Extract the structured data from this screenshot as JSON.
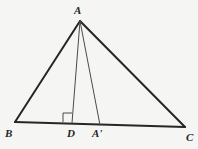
{
  "figure": {
    "kind": "geometry-diagram",
    "background_color": "#f5f5f4",
    "stroke_color": "#262626",
    "thin_stroke_color": "#4a4a4a",
    "canvas": {
      "width": 198,
      "height": 149
    },
    "labels": {
      "apex": "A",
      "left_base": "B",
      "right_base": "C",
      "foot_of_altitude": "D",
      "cevian_foot": "A'"
    },
    "points": {
      "A": {
        "x": 80,
        "y": 21
      },
      "B": {
        "x": 15,
        "y": 122
      },
      "C": {
        "x": 185,
        "y": 127
      },
      "D": {
        "x": 72,
        "y": 123
      },
      "Ap": {
        "x": 100,
        "y": 125
      }
    },
    "segments": [
      {
        "name": "side-AB",
        "from": "A",
        "to": "B",
        "weight": "thick"
      },
      {
        "name": "side-AC",
        "from": "A",
        "to": "C",
        "weight": "thick"
      },
      {
        "name": "base-BC",
        "from": "B",
        "to": "C",
        "weight": "thick"
      },
      {
        "name": "altitude-AD",
        "from": "A",
        "to": "D",
        "weight": "thin"
      },
      {
        "name": "cevian-AAp",
        "from": "A",
        "to": "Ap",
        "weight": "thin"
      }
    ],
    "right_angle_marker": {
      "name": "right-angle-at-D",
      "at": "D",
      "size": 9
    }
  }
}
